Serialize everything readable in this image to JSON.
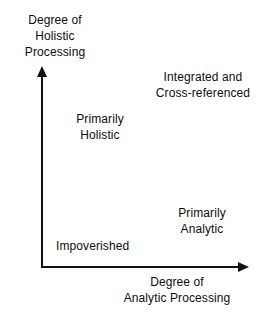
{
  "chart_data": {
    "type": "scatter",
    "title": "",
    "xlabel": "Degree of\nAnalytic Processing",
    "ylabel": "Degree of\nHolistic\nProcessing",
    "grid": false,
    "legend": null,
    "axes": {
      "x": {
        "label": "Degree of Analytic Processing",
        "arrow": true,
        "ticks": []
      },
      "y": {
        "label": "Degree of Holistic Processing",
        "arrow": true,
        "ticks": []
      }
    },
    "annotations": [
      {
        "text": "Integrated and\nCross-referenced",
        "quadrant": "top-right",
        "x": "high",
        "y": "high"
      },
      {
        "text": "Primarily\nHolistic",
        "quadrant": "top-left",
        "x": "low",
        "y": "high"
      },
      {
        "text": "Primarily\nAnalytic",
        "quadrant": "bottom-right",
        "x": "high",
        "y": "low"
      },
      {
        "text": "Impoverished",
        "quadrant": "bottom-left",
        "x": "low",
        "y": "low"
      }
    ]
  },
  "figure": {
    "axis_label_y": "Degree of\nHolistic\nProcessing",
    "axis_label_x": "Degree of\nAnalytic Processing",
    "quadrants": {
      "integrated": "Integrated and\nCross-referenced",
      "holistic": "Primarily\nHolistic",
      "analytic": "Primarily\nAnalytic",
      "impoverished": "Impoverished"
    },
    "colors": {
      "background": "#ffffff",
      "ink": "#0d0d0d",
      "axis": "#111111"
    }
  }
}
